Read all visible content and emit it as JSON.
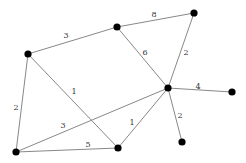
{
  "graph": {
    "nodes": [
      {
        "id": "A",
        "x": 28,
        "y": 54
      },
      {
        "id": "B",
        "x": 117,
        "y": 27
      },
      {
        "id": "C",
        "x": 194,
        "y": 13
      },
      {
        "id": "D",
        "x": 168,
        "y": 88
      },
      {
        "id": "E",
        "x": 232,
        "y": 92
      },
      {
        "id": "F",
        "x": 182,
        "y": 142
      },
      {
        "id": "G",
        "x": 16,
        "y": 152
      },
      {
        "id": "H",
        "x": 118,
        "y": 148
      }
    ],
    "edges": [
      {
        "from": "A",
        "to": "B",
        "weight": "3",
        "lx": 66,
        "ly": 38
      },
      {
        "from": "B",
        "to": "C",
        "weight": "8",
        "lx": 154,
        "ly": 17
      },
      {
        "from": "B",
        "to": "D",
        "weight": "6",
        "lx": 145,
        "ly": 55
      },
      {
        "from": "C",
        "to": "D",
        "weight": "2",
        "lx": 186,
        "ly": 55
      },
      {
        "from": "A",
        "to": "G",
        "weight": "2",
        "lx": 16,
        "ly": 110
      },
      {
        "from": "A",
        "to": "H",
        "weight": "1",
        "lx": 74,
        "ly": 94
      },
      {
        "from": "G",
        "to": "D",
        "weight": "3",
        "lx": 63,
        "ly": 128
      },
      {
        "from": "G",
        "to": "H",
        "weight": "5",
        "lx": 88,
        "ly": 147
      },
      {
        "from": "H",
        "to": "D",
        "weight": "1",
        "lx": 132,
        "ly": 125
      },
      {
        "from": "D",
        "to": "E",
        "weight": "4",
        "lx": 198,
        "ly": 89
      },
      {
        "from": "D",
        "to": "F",
        "weight": "2",
        "lx": 180,
        "ly": 118
      }
    ]
  }
}
